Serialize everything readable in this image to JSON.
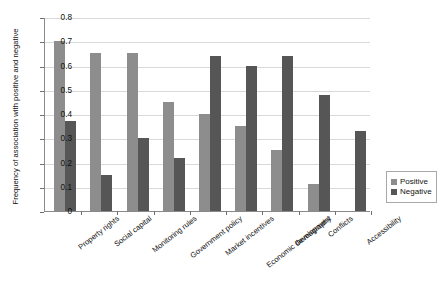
{
  "chart_data": {
    "type": "bar",
    "title": "",
    "xlabel": "",
    "ylabel": "Frequency of association with positive and negative",
    "ylim": [
      0,
      0.8
    ],
    "ytick_labels": [
      "0.8",
      "0.7",
      "0.6",
      "0.5",
      "0.4",
      "0.3",
      "0.2",
      "0.1",
      "0"
    ],
    "ytick_values": [
      0.8,
      0.7,
      0.6,
      0.5,
      0.4,
      0.3,
      0.2,
      0.1,
      0
    ],
    "grid": true,
    "legend_position": "right",
    "categories": [
      "Property rights",
      "Social capital",
      "Monitoring rules",
      "Government policy",
      "Market incentives",
      "Economic development",
      "Demography",
      "Conflicts",
      "Accessibility"
    ],
    "series": [
      {
        "name": "Positive",
        "color": "#8d8d8d",
        "values": [
          0.7,
          0.65,
          0.65,
          0.45,
          0.4,
          0.35,
          0.25,
          0.11,
          0
        ]
      },
      {
        "name": "Negative",
        "color": "#565656",
        "values": [
          0.37,
          0.15,
          0.3,
          0.22,
          0.64,
          0.6,
          0.64,
          0.48,
          0.33
        ]
      }
    ]
  },
  "legend": {
    "items": [
      {
        "label": "Positive",
        "color": "#8d8d8d"
      },
      {
        "label": "Negative",
        "color": "#565656"
      }
    ]
  }
}
